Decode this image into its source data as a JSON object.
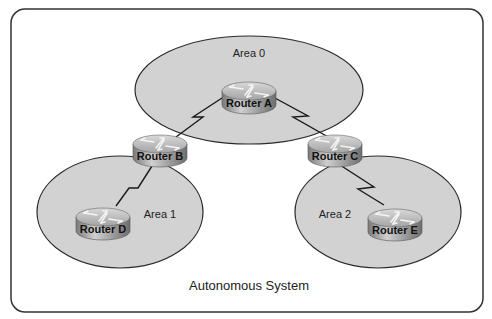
{
  "diagram": {
    "title": "Autonomous System",
    "colors": {
      "border": "#333333",
      "area_fill": "#d2d2d2",
      "link": "#1a1a1a",
      "router_top": "#b8b8b8",
      "router_body": "#8c8c8c"
    },
    "areas": [
      {
        "id": "area0",
        "label": "Area 0",
        "cx": 249,
        "cy": 90,
        "rx": 114,
        "ry": 54,
        "label_x": 249,
        "label_y": 57
      },
      {
        "id": "area1",
        "label": "Area 1",
        "cx": 120,
        "cy": 212,
        "rx": 83,
        "ry": 56,
        "label_x": 160,
        "label_y": 218
      },
      {
        "id": "area2",
        "label": "Area 2",
        "cx": 378,
        "cy": 212,
        "rx": 83,
        "ry": 56,
        "label_x": 335,
        "label_y": 218
      }
    ],
    "routers": [
      {
        "id": "A",
        "label": "Router A",
        "cx": 249,
        "cy": 95
      },
      {
        "id": "B",
        "label": "Router B",
        "cx": 160,
        "cy": 148
      },
      {
        "id": "C",
        "label": "Router C",
        "cx": 335,
        "cy": 148
      },
      {
        "id": "D",
        "label": "Router D",
        "cx": 103,
        "cy": 221
      },
      {
        "id": "E",
        "label": "Router E",
        "cx": 395,
        "cy": 222
      }
    ],
    "links": [
      {
        "from": "A",
        "to": "B",
        "points": "222,98 193,117 203,117 176,137"
      },
      {
        "from": "A",
        "to": "C",
        "points": "273,97 308,116 293,117 330,138"
      },
      {
        "from": "B",
        "to": "D",
        "points": "152,166 138,188 129,188 116,206"
      },
      {
        "from": "C",
        "to": "E",
        "points": "340,165 374,187 358,189 384,205"
      }
    ]
  }
}
